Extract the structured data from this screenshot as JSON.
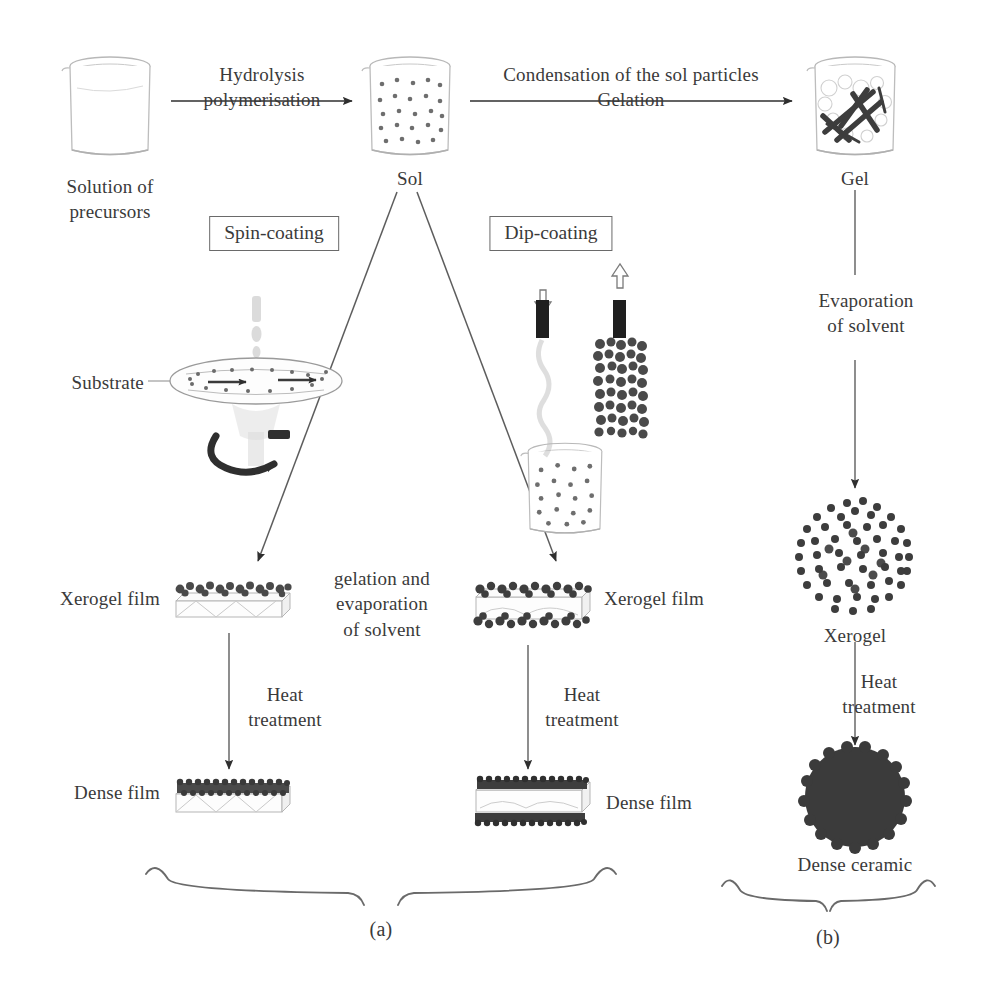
{
  "diagram": {
    "background": "#ffffff",
    "ink": "#3a3a3a"
  },
  "nodes": {
    "solution": {
      "label": "Solution of\nprecursors",
      "icon": "beaker-clear-icon"
    },
    "sol": {
      "label": "Sol",
      "icon": "beaker-sol-particles-icon"
    },
    "gel": {
      "label": "Gel",
      "icon": "beaker-gel-network-icon"
    },
    "substrate": {
      "label": "Substrate",
      "icon": "spinning-disc-icon"
    },
    "dip_bath": {
      "label": "",
      "icon": "beaker-sol-particles-icon"
    },
    "xerogel_film_left": {
      "label": "Xerogel film",
      "icon": "film-single-coated-icon"
    },
    "xerogel_film_right": {
      "label": "Xerogel film",
      "icon": "film-double-coated-icon"
    },
    "dense_film_left": {
      "label": "Dense film",
      "icon": "film-single-dense-icon"
    },
    "dense_film_right": {
      "label": "Dense film",
      "icon": "film-double-dense-icon"
    },
    "xerogel": {
      "label": "Xerogel",
      "icon": "porous-sphere-icon"
    },
    "dense_ceramic": {
      "label": "Dense ceramic",
      "icon": "dense-sphere-icon"
    }
  },
  "process_labels": {
    "hydrolysis": "Hydrolysis\npolymerisation",
    "condensation": "Condensation of the sol particles\nGelation",
    "evaporation": "Evaporation\nof solvent",
    "gelation_evaporation": "gelation and\nevaporation\nof solvent",
    "heat_left": "Heat\ntreatment",
    "heat_middle": "Heat\ntreatment",
    "heat_right": "Heat\ntreatment"
  },
  "method_boxes": {
    "spin": "Spin-coating",
    "dip": "Dip-coating"
  },
  "captions": {
    "a": "(a)",
    "b": "(b)"
  }
}
